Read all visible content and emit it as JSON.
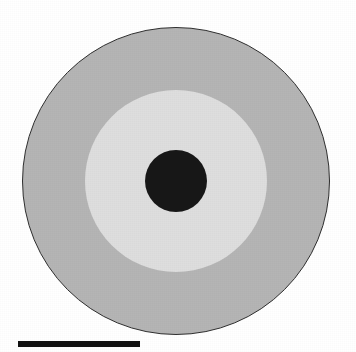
{
  "figure": {
    "name": "concentric-zone-micrograph",
    "background_color": "#ffffff",
    "width": 356,
    "height": 352,
    "caption": "",
    "alt_text": "Grayscale micrograph showing three concentric circular zones: a dark central core, a light gray intermediate zone, and a medium gray outer zone outlined in black."
  },
  "specimen": {
    "shape": "concentric-circles",
    "center_x": 176,
    "center_y": 181,
    "zones": [
      {
        "id": "outer",
        "label": "",
        "color": "#b5b5b5",
        "outline_color": "#2e2e2e",
        "radius_px": 154
      },
      {
        "id": "middle",
        "label": "",
        "color": "#dedede",
        "outline_color": "",
        "radius_px": 91
      },
      {
        "id": "core",
        "label": "",
        "color": "#171717",
        "outline_color": "",
        "radius_px": 31
      }
    ]
  },
  "scale_bar": {
    "label": "",
    "color": "#111111",
    "length_px": 122,
    "thickness_px": 6
  }
}
